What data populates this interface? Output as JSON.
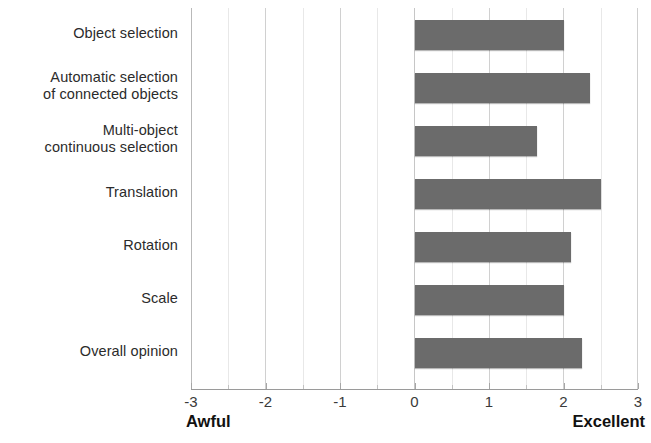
{
  "chart_data": {
    "type": "bar",
    "orientation": "horizontal",
    "title": "",
    "subtitle": "",
    "xlabel": "",
    "ylabel": "",
    "categories": [
      "Object selection",
      "Automatic selection of connected objects",
      "Multi-object continuous selection",
      "Translation",
      "Rotation",
      "Scale",
      "Overall opinion"
    ],
    "category_lines": [
      [
        "Object selection"
      ],
      [
        "Automatic selection",
        "of connected objects"
      ],
      [
        "Multi-object",
        "continuous selection"
      ],
      [
        "Translation"
      ],
      [
        "Rotation"
      ],
      [
        "Scale"
      ],
      [
        "Overall opinion"
      ]
    ],
    "values": [
      2.0,
      2.35,
      1.65,
      2.5,
      2.1,
      2.0,
      2.25
    ],
    "xlim": [
      -3,
      3
    ],
    "xticks": [
      -3,
      -2,
      -1,
      0,
      1,
      2,
      3
    ],
    "xticklabels": [
      "-3",
      "-2",
      "-1",
      "0",
      "1",
      "2",
      "3"
    ],
    "minor_xticks": [
      -2.5,
      -1.5,
      -0.5,
      0.5,
      1.5,
      2.5
    ],
    "grid": true,
    "legend": null,
    "scale_endpoints": {
      "low_label": "Awful",
      "low_value": "-3",
      "high_label": "Excellent",
      "high_value": "3"
    },
    "colors": {
      "bar": "#6b6b6b",
      "gridline": "#d0d0d0",
      "minor_gridline": "#e8e8e8",
      "axis": "#9a9a9a",
      "text": "#2b2b2b",
      "background": "#ffffff"
    }
  }
}
